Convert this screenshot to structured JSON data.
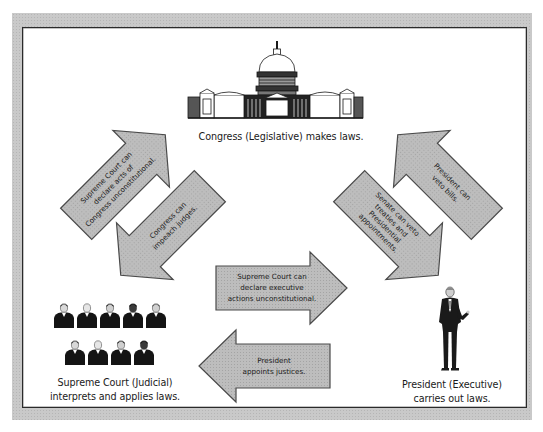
{
  "diagram": {
    "branches": {
      "legislative": {
        "icon": "capitol-building-icon",
        "caption": "Congress (Legislative) makes laws."
      },
      "judicial": {
        "icon": "justices-group-icon",
        "caption_line1": "Supreme Court (Judicial)",
        "caption_line2": "interprets and applies laws."
      },
      "executive": {
        "icon": "president-figure-icon",
        "caption_line1": "President (Executive)",
        "caption_line2": "carries out laws."
      }
    },
    "arrows": [
      {
        "id": "judicial-to-legislative",
        "from": "Supreme Court",
        "to": "Congress",
        "lines": [
          "Supreme Court can",
          "declare acts of",
          "Congress unconstitutional."
        ]
      },
      {
        "id": "legislative-to-judicial",
        "from": "Congress",
        "to": "Supreme Court",
        "lines": [
          "Congress can",
          "impeach judges."
        ]
      },
      {
        "id": "executive-to-legislative",
        "from": "President",
        "to": "Congress",
        "lines": [
          "President can",
          "veto bills."
        ]
      },
      {
        "id": "legislative-to-executive",
        "from": "Congress",
        "to": "President",
        "lines": [
          "Senate can veto",
          "treaties and",
          "Presidential",
          "appointments."
        ]
      },
      {
        "id": "judicial-to-executive",
        "from": "Supreme Court",
        "to": "President",
        "lines": [
          "Supreme Court can",
          "declare executive",
          "actions unconstitutional."
        ]
      },
      {
        "id": "executive-to-judicial",
        "from": "President",
        "to": "Supreme Court",
        "lines": [
          "President",
          "appoints justices."
        ]
      }
    ],
    "colors": {
      "frame": "#c9c9c9",
      "arrow_fill": "#b4b4b4",
      "arrow_stroke": "#4a4a4a",
      "ink": "#1a1a1a",
      "panel": "#ffffff"
    }
  }
}
